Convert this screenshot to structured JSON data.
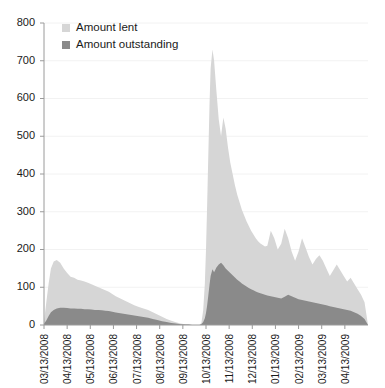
{
  "chart_data": {
    "type": "area",
    "title": "",
    "xlabel": "",
    "ylabel": "",
    "ylim": [
      0,
      800
    ],
    "ytick_values": [
      0,
      100,
      200,
      300,
      400,
      500,
      600,
      700,
      800
    ],
    "ytick_labels": [
      "0",
      "100",
      "200",
      "300",
      "400",
      "500",
      "600",
      "700",
      "800"
    ],
    "grid": true,
    "grid_axis": "y",
    "legend_position": "top-left",
    "stacked": false,
    "categories": [
      "03/13/2008",
      "04/13/2008",
      "05/13/2008",
      "06/13/2008",
      "07/13/2008",
      "08/13/2008",
      "09/13/2008",
      "10/13/2008",
      "11/13/2008",
      "12/13/2008",
      "01/13/2009",
      "02/13/2009",
      "03/13/2009",
      "04/13/2009"
    ],
    "xtick_labels": [
      "03/13/2008",
      "04/13/2008",
      "05/13/2008",
      "06/13/2008",
      "07/13/2008",
      "08/13/2008",
      "09/13/2008",
      "10/13/2008",
      "11/13/2008",
      "12/13/2008",
      "01/13/2009",
      "02/13/2009",
      "03/13/2009",
      "04/13/2009"
    ],
    "series": [
      {
        "name": "Amount lent",
        "color": "#d6d6d6",
        "x": [
          0,
          0.1,
          0.2,
          0.3,
          0.42,
          0.55,
          0.7,
          0.85,
          1.0,
          1.15,
          1.3,
          1.45,
          1.6,
          1.75,
          1.9,
          2.05,
          2.2,
          2.35,
          2.5,
          2.65,
          2.8,
          2.95,
          3.1,
          3.3,
          3.5,
          3.7,
          3.9,
          4.1,
          4.3,
          4.5,
          4.7,
          4.9,
          5.1,
          5.3,
          5.5,
          5.7,
          5.9,
          6.1,
          6.25,
          6.4,
          6.5,
          6.58,
          6.65,
          6.72,
          6.8,
          6.88,
          6.95,
          7.0,
          7.05,
          7.1,
          7.15,
          7.2,
          7.28,
          7.35,
          7.45,
          7.55,
          7.65,
          7.75,
          7.85,
          7.95,
          8.05,
          8.15,
          8.25,
          8.35,
          8.45,
          8.55,
          8.65,
          8.75,
          8.85,
          8.95,
          9.05,
          9.15,
          9.25,
          9.35,
          9.45,
          9.55,
          9.65,
          9.8,
          9.95,
          10.1,
          10.25,
          10.4,
          10.55,
          10.7,
          10.85,
          11.0,
          11.15,
          11.3,
          11.45,
          11.6,
          11.75,
          11.9,
          12.05,
          12.2,
          12.35,
          12.5,
          12.65,
          12.8,
          12.95,
          13.1,
          13.25,
          13.4,
          13.55,
          13.7,
          13.85,
          14.0
        ],
        "values": [
          10,
          60,
          110,
          150,
          168,
          172,
          165,
          150,
          138,
          128,
          125,
          120,
          118,
          115,
          112,
          108,
          104,
          100,
          96,
          92,
          88,
          82,
          76,
          70,
          64,
          58,
          52,
          48,
          44,
          40,
          34,
          28,
          22,
          16,
          11,
          7,
          4,
          2,
          1,
          0,
          0,
          0,
          0,
          0,
          5,
          40,
          110,
          200,
          320,
          450,
          580,
          680,
          730,
          700,
          620,
          545,
          500,
          550,
          520,
          470,
          430,
          400,
          370,
          345,
          325,
          305,
          290,
          275,
          262,
          250,
          240,
          230,
          222,
          216,
          212,
          208,
          210,
          250,
          230,
          200,
          215,
          255,
          230,
          195,
          170,
          195,
          230,
          205,
          180,
          160,
          175,
          185,
          170,
          150,
          130,
          145,
          160,
          145,
          130,
          115,
          125,
          110,
          95,
          80,
          60,
          0
        ]
      },
      {
        "name": "Amount outstanding",
        "color": "#8a8a8a",
        "x": [
          0,
          0.1,
          0.2,
          0.3,
          0.42,
          0.55,
          0.7,
          0.85,
          1.0,
          1.15,
          1.3,
          1.45,
          1.6,
          1.75,
          1.9,
          2.05,
          2.2,
          2.35,
          2.5,
          2.65,
          2.8,
          2.95,
          3.1,
          3.3,
          3.5,
          3.7,
          3.9,
          4.1,
          4.3,
          4.5,
          4.7,
          4.9,
          5.1,
          5.3,
          5.5,
          5.7,
          5.9,
          6.1,
          6.25,
          6.4,
          6.5,
          6.58,
          6.65,
          6.72,
          6.8,
          6.88,
          6.95,
          7.0,
          7.05,
          7.1,
          7.15,
          7.2,
          7.28,
          7.35,
          7.45,
          7.55,
          7.65,
          7.75,
          7.85,
          7.95,
          8.05,
          8.15,
          8.25,
          8.35,
          8.45,
          8.55,
          8.65,
          8.75,
          8.85,
          8.95,
          9.05,
          9.15,
          9.25,
          9.35,
          9.45,
          9.55,
          9.65,
          9.8,
          9.95,
          10.1,
          10.25,
          10.4,
          10.55,
          10.7,
          10.85,
          11.0,
          11.15,
          11.3,
          11.45,
          11.6,
          11.75,
          11.9,
          12.05,
          12.2,
          12.35,
          12.5,
          12.65,
          12.8,
          12.95,
          13.1,
          13.25,
          13.4,
          13.55,
          13.7,
          13.85,
          14.0
        ],
        "values": [
          3,
          12,
          24,
          34,
          40,
          44,
          46,
          46,
          45,
          44,
          44,
          43,
          43,
          42,
          42,
          41,
          40,
          40,
          39,
          38,
          37,
          35,
          33,
          31,
          29,
          27,
          25,
          23,
          21,
          19,
          16,
          13,
          10,
          8,
          5,
          4,
          2,
          1,
          1,
          0,
          0,
          0,
          0,
          0,
          2,
          8,
          18,
          32,
          52,
          78,
          105,
          130,
          148,
          140,
          152,
          160,
          165,
          158,
          150,
          144,
          138,
          132,
          126,
          120,
          115,
          110,
          106,
          102,
          98,
          95,
          92,
          89,
          86,
          84,
          82,
          80,
          78,
          76,
          74,
          72,
          70,
          75,
          80,
          76,
          72,
          68,
          66,
          64,
          62,
          60,
          58,
          56,
          54,
          52,
          50,
          48,
          46,
          44,
          42,
          40,
          38,
          34,
          30,
          24,
          16,
          0
        ]
      }
    ]
  },
  "legend": {
    "items": [
      {
        "label": "Amount lent",
        "color": "#d6d6d6"
      },
      {
        "label": "Amount outstanding",
        "color": "#8a8a8a"
      }
    ]
  }
}
